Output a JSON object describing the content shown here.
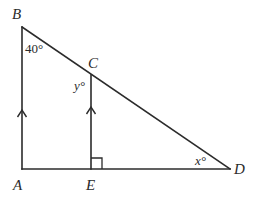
{
  "diagram": {
    "stroke_color": "#2b2b2b",
    "points": {
      "A": {
        "label": "A",
        "x": 22,
        "y": 169
      },
      "B": {
        "label": "B",
        "x": 22,
        "y": 27
      },
      "C": {
        "label": "C",
        "x": 91,
        "y": 75
      },
      "D": {
        "label": "D",
        "x": 230,
        "y": 169
      },
      "E": {
        "label": "E",
        "x": 91,
        "y": 169
      }
    },
    "segments": [
      {
        "from": "A",
        "to": "B",
        "marker": "parallel-arrow"
      },
      {
        "from": "B",
        "to": "D"
      },
      {
        "from": "A",
        "to": "D"
      },
      {
        "from": "E",
        "to": "C",
        "marker": "parallel-arrow"
      }
    ],
    "right_angle_at": "E",
    "angles": {
      "B": {
        "label": "40°",
        "value": 40
      },
      "C": {
        "label": "y°",
        "variable": "y"
      },
      "D": {
        "label": "x°",
        "variable": "x"
      }
    }
  }
}
